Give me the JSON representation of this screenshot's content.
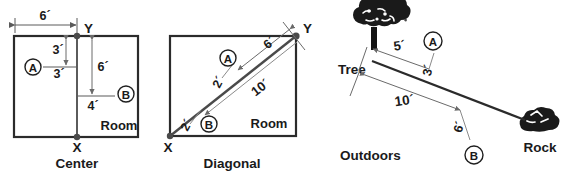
{
  "figure": {
    "title": "",
    "panels": [
      {
        "id": "center",
        "caption": "Center",
        "room_label": "Room",
        "point_x": "X",
        "point_y": "Y",
        "marker_a": "A",
        "marker_b": "B",
        "dimensions": {
          "top_width": "6´",
          "a_vertical": "3´",
          "a_horizontal": "3´",
          "b_vertical": "6´",
          "b_horizontal": "4´"
        }
      },
      {
        "id": "diagonal",
        "caption": "Diagonal",
        "room_label": "Room",
        "point_x": "X",
        "point_y": "Y",
        "marker_a": "A",
        "marker_b": "B",
        "dimensions": {
          "a_along": "6´",
          "a_offset": "2´",
          "b_along": "10´",
          "b_offset": "2´"
        }
      },
      {
        "id": "outdoors",
        "caption": "Outdoors",
        "tree_label": "Tree",
        "rock_label": "Rock",
        "marker_a": "A",
        "marker_b": "B",
        "dimensions": {
          "a_along": "5´",
          "a_offset": "3´",
          "b_along": "10´",
          "b_offset": "6´"
        }
      }
    ],
    "colors": {
      "ink": "#1a1a1a",
      "line": "#3a3a3a",
      "thin": "#8a8a8a",
      "background": "#ffffff"
    }
  }
}
